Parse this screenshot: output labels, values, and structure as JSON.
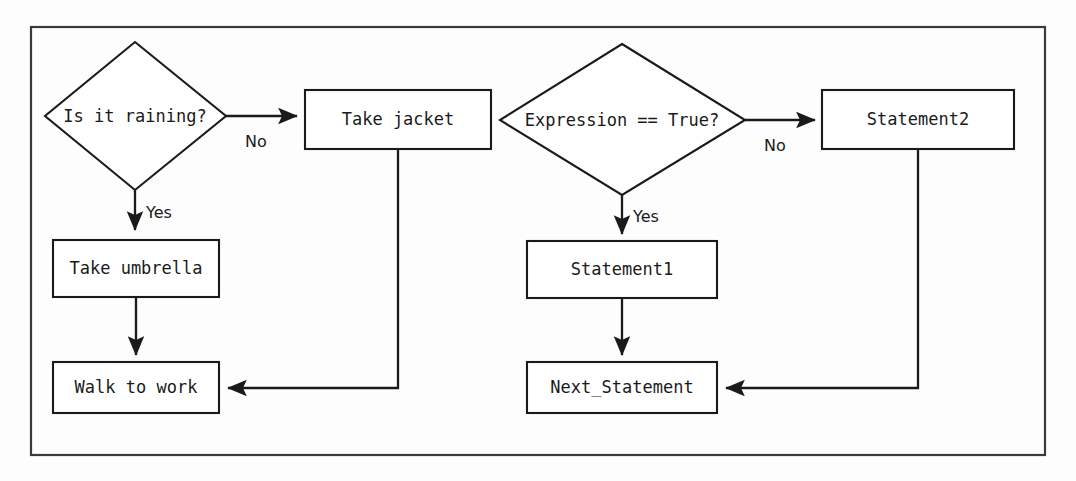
{
  "diagram": {
    "frame": {
      "name": "outer-border"
    },
    "colors": {
      "background": "#fdfdfd",
      "stroke": "#1a1a1a",
      "frame_stroke": "#3a3a3a",
      "node_fill": "#ffffff"
    },
    "left_flow": {
      "name": "real-world-example",
      "decision": {
        "label": "Is it raining?",
        "shape": "diamond"
      },
      "nodes": [
        {
          "id": "take-jacket",
          "label": "Take jacket",
          "shape": "rectangle"
        },
        {
          "id": "take-umbrella",
          "label": "Take umbrella",
          "shape": "rectangle"
        },
        {
          "id": "walk-to-work",
          "label": "Walk to work",
          "shape": "rectangle"
        }
      ],
      "edges": [
        {
          "from": "Is it raining?",
          "to": "Take jacket",
          "label": "No"
        },
        {
          "from": "Is it raining?",
          "to": "Take umbrella",
          "label": "Yes"
        },
        {
          "from": "Take umbrella",
          "to": "Walk to work",
          "label": ""
        },
        {
          "from": "Take jacket",
          "to": "Walk to work",
          "label": ""
        }
      ]
    },
    "right_flow": {
      "name": "generic-example",
      "decision": {
        "label": "Expression == True?",
        "shape": "diamond"
      },
      "nodes": [
        {
          "id": "statement2",
          "label": "Statement2",
          "shape": "rectangle"
        },
        {
          "id": "statement1",
          "label": "Statement1",
          "shape": "rectangle"
        },
        {
          "id": "next-statement",
          "label": "Next_Statement",
          "shape": "rectangle"
        }
      ],
      "edges": [
        {
          "from": "Expression == True?",
          "to": "Statement2",
          "label": "No"
        },
        {
          "from": "Expression == True?",
          "to": "Statement1",
          "label": "Yes"
        },
        {
          "from": "Statement1",
          "to": "Next_Statement",
          "label": ""
        },
        {
          "from": "Statement2",
          "to": "Next_Statement",
          "label": ""
        }
      ]
    },
    "labels": {
      "no_left": "No",
      "yes_left": "Yes",
      "no_right": "No",
      "yes_right": "Yes",
      "decision_left": "Is it raining?",
      "decision_right": "Expression == True?",
      "take_jacket": "Take jacket",
      "take_umbrella": "Take umbrella",
      "walk_to_work": "Walk to work",
      "statement1": "Statement1",
      "statement2": "Statement2",
      "next_statement": "Next_Statement"
    }
  }
}
